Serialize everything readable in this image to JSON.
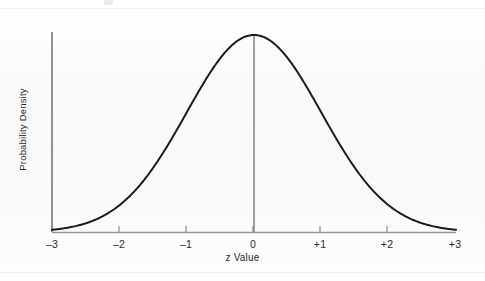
{
  "figure": {
    "background_color": "#fcfcfc",
    "curve_color": "#1a1a1a",
    "axis_color": "#8c8c8c",
    "text_color": "#2b2b2b",
    "center_line_color": "#6f6f6f"
  },
  "axes": {
    "x_title": "z Value",
    "y_title": "Probability Density"
  },
  "chart_data": {
    "type": "line",
    "title": "",
    "subtitle": "",
    "xlabel": "z Value",
    "ylabel": "Probability Density",
    "xlim": [
      -3,
      3
    ],
    "ylim": [
      0,
      0.4
    ],
    "grid": false,
    "legend": null,
    "xticklabels": [
      "–3",
      "–2",
      "–1",
      "0",
      "+1",
      "+2",
      "+3"
    ],
    "xticks": [
      -3,
      -2,
      -1,
      0,
      1,
      2,
      3
    ],
    "yticks": [],
    "yticklabels": [],
    "annotations": [
      {
        "name": "center-line",
        "x": 0,
        "description": "vertical line at z = 0 from baseline to curve apex"
      }
    ],
    "series": [
      {
        "name": "Standard normal probability density",
        "distribution": "normal",
        "mean": 0,
        "sd": 1,
        "x": [
          -3,
          -2.75,
          -2.5,
          -2.25,
          -2,
          -1.75,
          -1.5,
          -1.25,
          -1,
          -0.75,
          -0.5,
          -0.25,
          0,
          0.25,
          0.5,
          0.75,
          1,
          1.25,
          1.5,
          1.75,
          2,
          2.25,
          2.5,
          2.75,
          3
        ],
        "values": [
          0.0044,
          0.0091,
          0.0175,
          0.0317,
          0.054,
          0.0863,
          0.1295,
          0.1826,
          0.242,
          0.3011,
          0.3521,
          0.3867,
          0.3989,
          0.3867,
          0.3521,
          0.3011,
          0.242,
          0.1826,
          0.1295,
          0.0863,
          0.054,
          0.0317,
          0.0175,
          0.0091,
          0.0044
        ]
      }
    ]
  }
}
